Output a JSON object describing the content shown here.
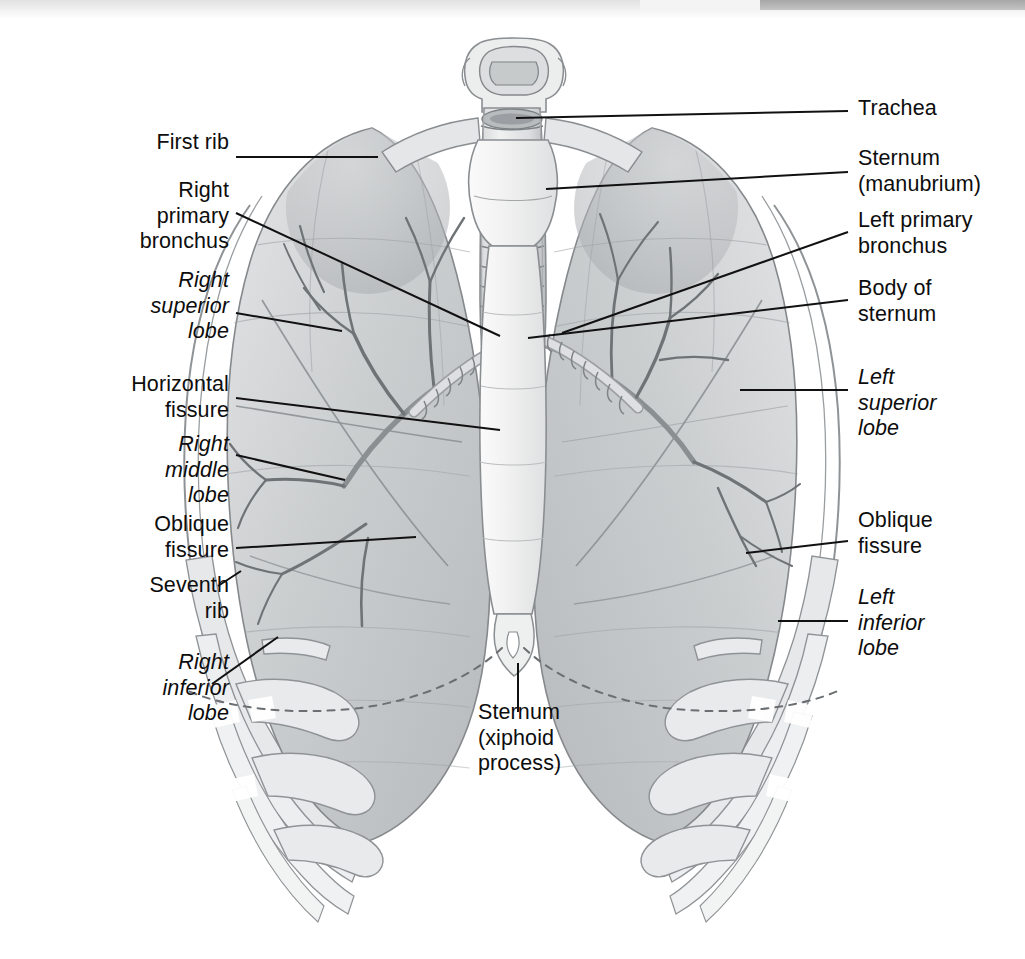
{
  "figure": {
    "view": "anterior",
    "colors": {
      "ink": "#0d0d0d",
      "leader_line": "#111111",
      "lung_tissue": "#cfd1d2",
      "lung_tissue_dark": "#a9acae",
      "bone": "#e9eaeb",
      "bone_shadow": "#c2c4c6",
      "cartilage": "#dcdddf",
      "sternum": "#f2f2f2",
      "outline": "#8c9093",
      "background": "#ffffff"
    },
    "scan_band": {
      "left_tone": "#dcdcdc",
      "right_tone": "#9d9d9d"
    }
  },
  "labels_left": [
    {
      "id": "first-rib",
      "text": "First rib",
      "italic": false,
      "x": 84,
      "y": 141,
      "align": "right",
      "width": 145
    },
    {
      "id": "right-primary-bronchus",
      "text": "Right\nprimary\nbronchus",
      "italic": false,
      "x": 60,
      "y": 188,
      "align": "right",
      "width": 169
    },
    {
      "id": "right-superior-lobe",
      "text": "Right\nsuperior\nlobe",
      "italic": true,
      "x": 60,
      "y": 277,
      "align": "right",
      "width": 169
    },
    {
      "id": "horizontal-fissure",
      "text": "Horizontal\nfissure",
      "italic": false,
      "x": 52,
      "y": 368,
      "align": "right",
      "width": 177
    },
    {
      "id": "right-middle-lobe",
      "text": "Right\nmiddle\nlobe",
      "italic": true,
      "x": 60,
      "y": 429,
      "align": "right",
      "width": 169
    },
    {
      "id": "oblique-fissure-right",
      "text": "Oblique\nfissure",
      "italic": false,
      "x": 60,
      "y": 511,
      "align": "right",
      "width": 169
    },
    {
      "id": "seventh-rib",
      "text": "Seventh\nrib",
      "italic": false,
      "x": 60,
      "y": 572,
      "align": "right",
      "width": 169
    },
    {
      "id": "right-inferior-lobe",
      "text": "Right\ninferior\nlobe",
      "italic": true,
      "x": 60,
      "y": 650,
      "align": "right",
      "width": 169
    }
  ],
  "labels_right": [
    {
      "id": "trachea",
      "text": "Trachea",
      "italic": false,
      "x": 858,
      "y": 96,
      "align": "left",
      "width": 165
    },
    {
      "id": "sternum-manubrium",
      "text": "Sternum\n(manubrium)",
      "italic": false,
      "x": 858,
      "y": 146,
      "align": "left",
      "width": 167
    },
    {
      "id": "left-primary-bronchus",
      "text": "Left primary\nbronchus",
      "italic": false,
      "x": 858,
      "y": 208,
      "align": "left",
      "width": 167
    },
    {
      "id": "body-of-sternum",
      "text": "Body of\nsternum",
      "italic": false,
      "x": 858,
      "y": 276,
      "align": "left",
      "width": 167
    },
    {
      "id": "left-superior-lobe",
      "text": "Left\nsuperior\nlobe",
      "italic": true,
      "x": 858,
      "y": 363,
      "align": "left",
      "width": 167
    },
    {
      "id": "oblique-fissure-left",
      "text": "Oblique\nfissure",
      "italic": false,
      "x": 858,
      "y": 507,
      "align": "left",
      "width": 167
    },
    {
      "id": "left-inferior-lobe",
      "text": "Left\ninferior\nlobe",
      "italic": true,
      "x": 858,
      "y": 584,
      "align": "left",
      "width": 167
    }
  ],
  "labels_center": [
    {
      "id": "sternum-xiphoid-process",
      "text": "Sternum\n(xiphoid\nprocess)",
      "italic": false,
      "x": 478,
      "y": 700,
      "align": "left",
      "width": 160
    }
  ],
  "leader_lines": [
    {
      "id": "leader-first-rib",
      "points": "236,157 378,157"
    },
    {
      "id": "leader-right-primary-bronchus",
      "points": "236,213 500,336"
    },
    {
      "id": "leader-right-superior-lobe",
      "points": "236,313 342,331"
    },
    {
      "id": "leader-horizontal-fissure",
      "points": "236,398 500,430"
    },
    {
      "id": "leader-right-middle-lobe",
      "points": "236,455 345,480"
    },
    {
      "id": "leader-oblique-fissure-right",
      "points": "236,548 416,537"
    },
    {
      "id": "leader-seventh-rib",
      "points": "218,586 240,572"
    },
    {
      "id": "leader-right-inferior-lobe",
      "points": "212,684 278,637"
    },
    {
      "id": "leader-trachea",
      "points": "848,111 516,118"
    },
    {
      "id": "leader-sternum-manubrium",
      "points": "848,172 546,189"
    },
    {
      "id": "leader-left-primary-bronchus",
      "points": "848,232 562,333"
    },
    {
      "id": "leader-body-of-sternum",
      "points": "848,300 528,338"
    },
    {
      "id": "leader-left-superior-lobe",
      "points": "848,390 740,390"
    },
    {
      "id": "leader-oblique-fissure-left",
      "points": "848,541 746,553"
    },
    {
      "id": "leader-left-inferior-lobe",
      "points": "848,621 778,621"
    },
    {
      "id": "leader-sternum-xiphoid",
      "points": "518,663 518,712"
    }
  ],
  "anatomy_parts": [
    {
      "id": "larynx",
      "name": "larynx"
    },
    {
      "id": "trachea-shaft",
      "name": "trachea"
    },
    {
      "id": "right-lung",
      "name": "right-lung"
    },
    {
      "id": "left-lung",
      "name": "left-lung"
    },
    {
      "id": "right-primary-bronchus",
      "name": "right-primary-bronchus"
    },
    {
      "id": "left-primary-bronchus",
      "name": "left-primary-bronchus"
    },
    {
      "id": "bronchial-tree-right",
      "name": "bronchial-tree-right"
    },
    {
      "id": "bronchial-tree-left",
      "name": "bronchial-tree-left"
    },
    {
      "id": "manubrium",
      "name": "manubrium"
    },
    {
      "id": "sternum-body",
      "name": "sternum-body"
    },
    {
      "id": "xiphoid-process",
      "name": "xiphoid-process"
    },
    {
      "id": "clavicles",
      "name": "clavicles"
    },
    {
      "id": "rib-cage",
      "name": "rib-cage"
    },
    {
      "id": "costal-cartilages",
      "name": "costal-cartilages"
    },
    {
      "id": "diaphragm-outline",
      "name": "diaphragm-dashed-outline"
    }
  ]
}
